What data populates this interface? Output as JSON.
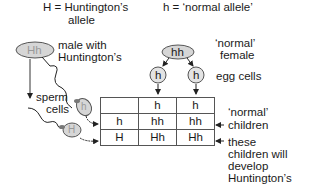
{
  "legend": {
    "dominant": "H = Huntington’s",
    "dominant_line2": "allele",
    "recessive": "h = ‘normal allele’"
  },
  "father": {
    "genotype": "Hh",
    "label_line1": "male with",
    "label_line2": "Huntington’s"
  },
  "mother": {
    "genotype": "hh",
    "label_line1": "‘normal’",
    "label_line2": "female"
  },
  "gametes": {
    "egg_label": "egg cells",
    "eggs": [
      "h",
      "h"
    ],
    "sperm_label_line1": "sperm",
    "sperm_label_line2": "cells",
    "sperm": [
      "h",
      "H"
    ]
  },
  "punnett": {
    "header": [
      "",
      "h",
      "h"
    ],
    "rows": [
      [
        "h",
        "hh",
        "hh"
      ],
      [
        "H",
        "Hh",
        "Hh"
      ]
    ]
  },
  "annotations": {
    "normal_children_line1": "‘normal’",
    "normal_children_line2": "children",
    "affected_line1": "these",
    "affected_line2": "children will",
    "affected_line3": "develop",
    "affected_line4": "Huntington’s"
  },
  "colors": {
    "cell_fill": "#d6d6d6",
    "cell_stroke": "#555555",
    "text_light": "#9a9a9a"
  }
}
